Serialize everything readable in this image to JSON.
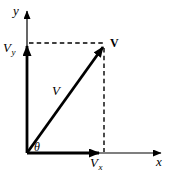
{
  "figure": {
    "type": "vector-decomposition-diagram",
    "background": "#ffffff",
    "ink_color": "#000000",
    "labels": {
      "y_axis": "y",
      "x_axis": "x",
      "vector_name_at_tip": "V",
      "vector_name_mid": "V",
      "y_component": {
        "base": "V",
        "sub": "y"
      },
      "x_component": {
        "base": "V",
        "sub": "x"
      },
      "angle": "θ"
    }
  }
}
